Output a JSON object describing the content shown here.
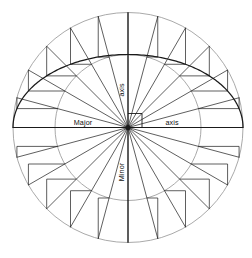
{
  "figure": {
    "type": "geometric-construction",
    "background_color": "#ffffff",
    "stroke_color": "#1a1a1a",
    "light_stroke_color": "#9a9a9a",
    "width": 252,
    "height": 258
  },
  "geometry": {
    "center": {
      "x": 128,
      "y": 127.5
    },
    "outer_circle_radius": 115,
    "inner_circle_radius": 73,
    "major_semi_axis": 115,
    "minor_semi_axis": 73,
    "spoke_count": 24,
    "spoke_angle_step_degrees": 15,
    "ellipse_arc_drawn_from_degrees": 0,
    "ellipse_arc_drawn_to_degrees": 180,
    "right_angle_marker": {
      "x": 128,
      "y": 127.5,
      "size": 14
    }
  },
  "labels": {
    "major_left": "Major",
    "major_right": "axis",
    "minor_top": "axis",
    "minor_bottom": "Minor"
  },
  "label_positions": {
    "major_left": {
      "x": 83,
      "y": 125,
      "rotation": 0
    },
    "major_right": {
      "x": 172,
      "y": 125,
      "rotation": 0
    },
    "minor_top": {
      "x": 124,
      "y": 90,
      "rotation": -90
    },
    "minor_bottom": {
      "x": 124,
      "y": 172,
      "rotation": -90
    }
  }
}
